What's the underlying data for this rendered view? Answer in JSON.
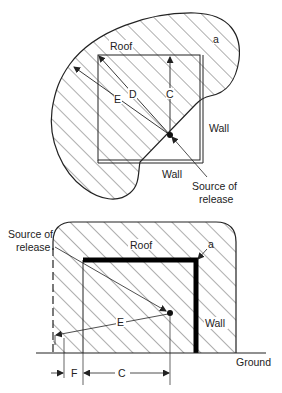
{
  "top_diagram": {
    "labels": {
      "roof": "Roof",
      "a": "a",
      "e": "E",
      "d": "D",
      "c": "C",
      "wall_right": "Wall",
      "wall_bottom": "Wall",
      "source_line1": "Source of",
      "source_line2": "release"
    }
  },
  "bottom_diagram": {
    "labels": {
      "source_line1": "Source of",
      "source_line2": "release",
      "roof": "Roof",
      "a": "a",
      "e": "E",
      "wall": "Wall",
      "ground": "Ground",
      "f": "F",
      "c": "C"
    }
  },
  "colors": {
    "line": "#222222",
    "background": "#ffffff"
  }
}
